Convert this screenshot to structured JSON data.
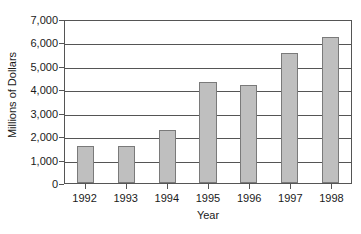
{
  "chart_data": {
    "type": "bar",
    "title": "",
    "subtitle": "",
    "xlabel": "Year",
    "ylabel": "Millions of Dollars",
    "categories": [
      "1992",
      "1993",
      "1994",
      "1995",
      "1996",
      "1997",
      "1998"
    ],
    "values": [
      1580,
      1560,
      2260,
      4330,
      4200,
      5550,
      6250
    ],
    "series": [
      {
        "name": "Millions of Dollars",
        "values": [
          1580,
          1560,
          2260,
          4330,
          4200,
          5550,
          6250
        ]
      }
    ],
    "ylim": [
      0,
      7000
    ],
    "ytick_step": 1000,
    "ytick_labels": [
      "0",
      "1,000",
      "2,000",
      "3,000",
      "4,000",
      "5,000",
      "6,000",
      "7,000"
    ],
    "ytick_values": [
      0,
      1000,
      2000,
      3000,
      4000,
      5000,
      6000,
      7000
    ],
    "grid": "horizontal",
    "legend": "none",
    "annotations": [],
    "colors": {
      "bar_fill": "#bfbfbf",
      "bar_border": "#7a7a7a",
      "axis": "#555555",
      "gridline": "#555555",
      "text": "#1a1a1a",
      "background": "#ffffff"
    }
  }
}
